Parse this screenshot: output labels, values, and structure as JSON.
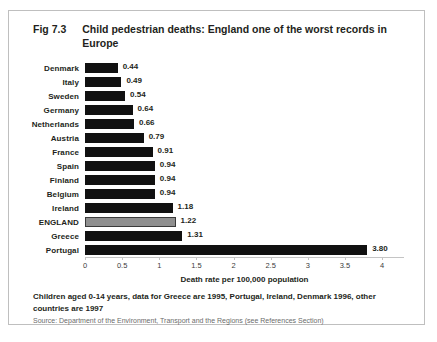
{
  "figure": {
    "number": "Fig 7.3",
    "title": "Child pedestrian deaths:  England one of the worst records in Europe"
  },
  "footnote": {
    "note": "Children aged 0-14 years, data for Greece are 1995, Portugal, Ireland, Denmark 1996, other countries are 1997",
    "source": "Source: Department of the Environment, Transport and the Regions (see References Section)"
  },
  "colors": {
    "bar": "#111111",
    "highlight_bar": "#8f8f8f",
    "frame": "#bfbfbf",
    "text": "#231f20",
    "axis": "#c4c4c4"
  },
  "chart_data": {
    "type": "bar",
    "orientation": "horizontal",
    "title": "Child pedestrian deaths:  England one of the worst records in Europe",
    "xlabel": "Death rate per 100,000 population",
    "ylabel": "",
    "xlim": [
      0,
      4
    ],
    "xticks": [
      "0",
      "0.5",
      "1",
      "1.5",
      "2",
      "2.5",
      "3",
      "3.5",
      "4"
    ],
    "xtick_values": [
      0,
      0.5,
      1,
      1.5,
      2,
      2.5,
      3,
      3.5,
      4
    ],
    "grid": false,
    "legend": false,
    "highlight_category": "ENGLAND",
    "categories": [
      "Denmark",
      "Italy",
      "Sweden",
      "Germany",
      "Netherlands",
      "Austria",
      "France",
      "Spain",
      "Finland",
      "Belgium",
      "Ireland",
      "ENGLAND",
      "Greece",
      "Portugal"
    ],
    "values": [
      0.44,
      0.49,
      0.54,
      0.64,
      0.66,
      0.79,
      0.91,
      0.94,
      0.94,
      0.94,
      1.18,
      1.22,
      1.31,
      3.8
    ],
    "value_labels": [
      "0.44",
      "0.49",
      "0.54",
      "0.64",
      "0.66",
      "0.79",
      "0.91",
      "0.94",
      "0.94",
      "0.94",
      "1.18",
      "1.22",
      "1.31",
      "3.80"
    ],
    "bars": [
      {
        "category": "Denmark",
        "value": 0.44,
        "label": "0.44",
        "highlight": false
      },
      {
        "category": "Italy",
        "value": 0.49,
        "label": "0.49",
        "highlight": false
      },
      {
        "category": "Sweden",
        "value": 0.54,
        "label": "0.54",
        "highlight": false
      },
      {
        "category": "Germany",
        "value": 0.64,
        "label": "0.64",
        "highlight": false
      },
      {
        "category": "Netherlands",
        "value": 0.66,
        "label": "0.66",
        "highlight": false
      },
      {
        "category": "Austria",
        "value": 0.79,
        "label": "0.79",
        "highlight": false
      },
      {
        "category": "France",
        "value": 0.91,
        "label": "0.91",
        "highlight": false
      },
      {
        "category": "Spain",
        "value": 0.94,
        "label": "0.94",
        "highlight": false
      },
      {
        "category": "Finland",
        "value": 0.94,
        "label": "0.94",
        "highlight": false
      },
      {
        "category": "Belgium",
        "value": 0.94,
        "label": "0.94",
        "highlight": false
      },
      {
        "category": "Ireland",
        "value": 1.18,
        "label": "1.18",
        "highlight": false
      },
      {
        "category": "ENGLAND",
        "value": 1.22,
        "label": "1.22",
        "highlight": true
      },
      {
        "category": "Greece",
        "value": 1.31,
        "label": "1.31",
        "highlight": false
      },
      {
        "category": "Portugal",
        "value": 3.8,
        "label": "3.80",
        "highlight": false
      }
    ]
  }
}
